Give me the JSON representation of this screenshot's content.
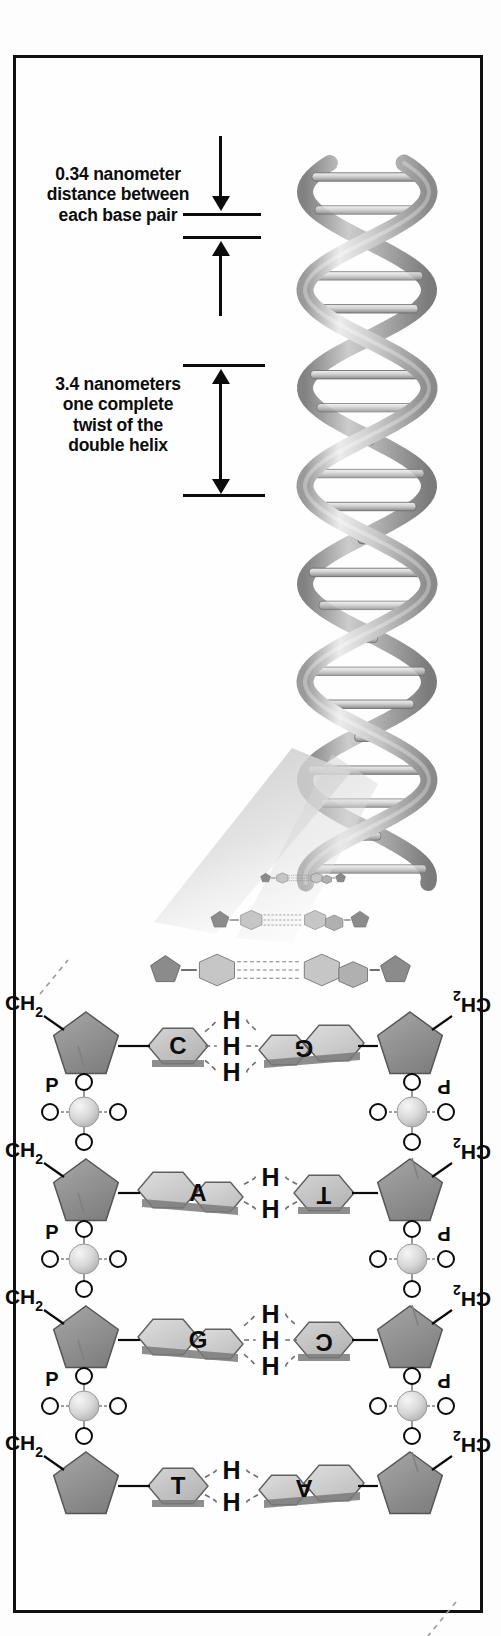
{
  "figure": {
    "border_color": "#111111",
    "background_color": "#fefefe"
  },
  "annotations": [
    {
      "id": "spacing",
      "lines": [
        "0.34 nanometer",
        "distance between",
        "each base pair"
      ],
      "value": 0.34,
      "unit": "nanometer",
      "measures": "distance between each base pair"
    },
    {
      "id": "pitch",
      "lines": [
        "3.4 nanometers",
        "one complete",
        "twist of the",
        "double helix"
      ],
      "value": 3.4,
      "unit": "nanometers",
      "measures": "one complete twist of the double helix"
    }
  ],
  "helix": {
    "name": "dna-double-helix",
    "style": "grayscale 3D ribbon rendering",
    "strand_count": 2,
    "rung_count": 22,
    "ribbon_light": "#e8e8e8",
    "ribbon_mid": "#b4b4b4",
    "ribbon_dark": "#7d7d7d",
    "outline": "#5c5c5c"
  },
  "transition": {
    "name": "unwinding-region",
    "description": "helix fans open into flat base pairs in perspective",
    "rows": [
      {
        "scale": 0.28,
        "left_base": "pyrimidine",
        "right_base": "purine"
      },
      {
        "scale": 0.52,
        "left_base": "pyrimidine",
        "right_base": "purine"
      },
      {
        "scale": 0.8,
        "left_base": "pyrimidine",
        "right_base": "purine"
      }
    ]
  },
  "ladder": {
    "left_strand_label": "5' to 3' strand (upright)",
    "right_strand_label": "complementary antiparallel strand (rotated 180°)",
    "sugar_label": "CH",
    "sugar_subscript": "2",
    "phosphate_label": "P",
    "oxygen_label": "O",
    "hydrogen_label": "H",
    "base_pairs": [
      {
        "index": 1,
        "left_base": "C",
        "right_base": "G",
        "left_type": "pyrimidine",
        "right_type": "purine",
        "hydrogen_bonds": 3
      },
      {
        "index": 2,
        "left_base": "A",
        "right_base": "T",
        "left_type": "purine",
        "right_type": "pyrimidine",
        "hydrogen_bonds": 2
      },
      {
        "index": 3,
        "left_base": "G",
        "right_base": "C",
        "left_type": "purine",
        "right_type": "pyrimidine",
        "hydrogen_bonds": 3
      },
      {
        "index": 4,
        "left_base": "T",
        "right_base": "A",
        "left_type": "pyrimidine",
        "right_type": "purine",
        "hydrogen_bonds": 2
      }
    ],
    "phosphate_groups_left": 3,
    "phosphate_groups_right": 3
  },
  "colors": {
    "ink": "#0b0b0b",
    "sugar_fill": "#8e8e8e",
    "purine_fill": "#cdcdcd",
    "pyrimidine_fill": "#bdbdbd",
    "base_shadow": "#7a7a7a",
    "phosphate_fill": "#d6d6d6",
    "oxygen_fill": "#ffffff",
    "bond_line": "#3a3a3a"
  }
}
